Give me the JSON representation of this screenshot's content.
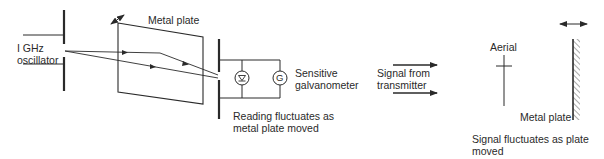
{
  "figure": {
    "left_panel": {
      "oscillator_label_line1": "I GHz",
      "oscillator_label_line2": "oscillator",
      "metal_plate_label": "Metal plate",
      "detector_label_line1": "Sensitive",
      "detector_label_line2": "galvanometer",
      "galvanometer_symbol": "G",
      "caption_line1": "Reading fluctuates as",
      "caption_line2": "metal plate moved"
    },
    "right_panel": {
      "signal_label_line1": "Signal from",
      "signal_label_line2": "transmitter",
      "aerial_label": "Aerial",
      "metal_plate_label": "Metal plate",
      "caption_line1": "Signal fluctuates as plate",
      "caption_line2": "moved"
    },
    "colors": {
      "line": "#2a2a2a",
      "text": "#2a2a2a",
      "background": "#ffffff"
    }
  }
}
